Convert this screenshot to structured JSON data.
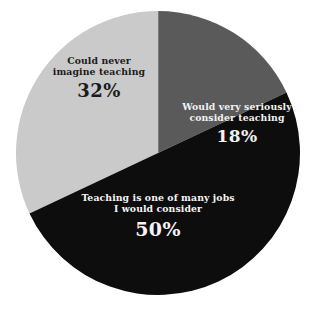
{
  "chart_data": {
    "type": "pie",
    "title": "",
    "subtitle": "",
    "xlabel": "",
    "ylabel": "",
    "legend_position": "none",
    "labels_inside_slices": true,
    "grid": false,
    "background_color": "#ffffff",
    "categories": [
      "Could never imagine teaching",
      "Would very seriously consider teaching",
      "Teaching is one of many jobs I would consider"
    ],
    "values": [
      32,
      18,
      50
    ],
    "value_unit": "%",
    "slices": [
      {
        "name": "could-never-imagine-teaching",
        "label_line1": "Could never",
        "label_line2": "imagine teaching",
        "value": 32,
        "value_text": "32%",
        "color": "#cacaca",
        "text_color": "#1b1b1b"
      },
      {
        "name": "would-very-seriously-consider-teaching",
        "label_line1": "Would very seriously",
        "label_line2": "consider teaching",
        "value": 18,
        "value_text": "18%",
        "color": "#5a5a5a",
        "text_color": "#f2f2f2"
      },
      {
        "name": "teaching-is-one-of-many-jobs",
        "label_line1": "Teaching is one of many jobs",
        "label_line2": "I would consider",
        "value": 50,
        "value_text": "50%",
        "color": "#0d0d0d",
        "text_color": "#f4f4f4"
      }
    ]
  }
}
